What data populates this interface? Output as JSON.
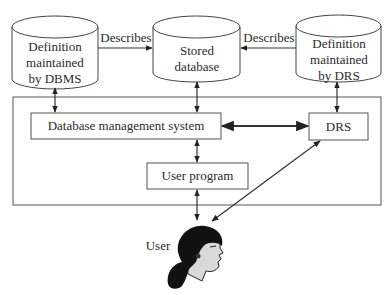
{
  "diagram": {
    "cylinders": [
      {
        "id": "dbms-definition",
        "lines": [
          "Definition",
          "maintained",
          "by DBMS"
        ]
      },
      {
        "id": "stored-database",
        "lines": [
          "Stored",
          "database"
        ]
      },
      {
        "id": "drs-definition",
        "lines": [
          "Definition",
          "maintained",
          "by DRS"
        ]
      }
    ],
    "edge_labels": {
      "left_describes": "Describes",
      "right_describes": "Describes"
    },
    "boxes": {
      "dbms": "Database management system",
      "drs": "DRS",
      "user_program": "User program"
    },
    "user_label": "User",
    "colors": {
      "line": "#333333",
      "box_border": "#555555",
      "outer_border": "#555555",
      "background": "#ffffff"
    }
  }
}
